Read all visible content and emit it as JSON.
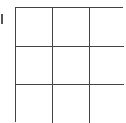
{
  "game": {
    "type": "tic-tac-toe-grid",
    "rows": 3,
    "cols": 3,
    "cells": [
      [
        "",
        "",
        ""
      ],
      [
        "",
        "",
        ""
      ],
      [
        "",
        "",
        ""
      ]
    ]
  },
  "colors": {
    "grid_line": "#444444",
    "background": "#ffffff"
  }
}
